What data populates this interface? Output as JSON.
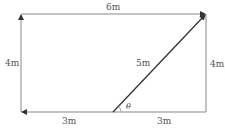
{
  "diagram": {
    "colors": {
      "line": "#888888",
      "diagonal": "#333333",
      "text": "#555555",
      "background": "#ffffff"
    },
    "labels": {
      "top": "6m",
      "left": "4m",
      "right": "4m",
      "diagonal": "5m",
      "bottom_left": "3m",
      "bottom_right": "3m",
      "angle": "θ"
    },
    "geometry": {
      "left_x": 21,
      "right_x": 206,
      "top_y": 14,
      "bottom_y": 112,
      "diag_start_x": 113
    }
  }
}
